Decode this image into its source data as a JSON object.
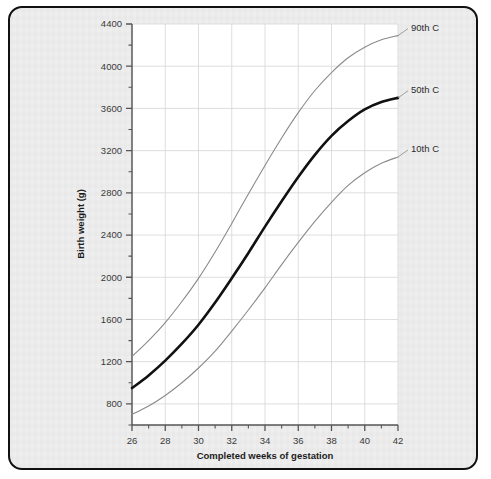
{
  "figure": {
    "frame_border_color": "#111111",
    "panel_background": "#eeeeee",
    "plot_background": "#ffffff",
    "grid_color": "#d6d6d6",
    "axis_color": "#555555",
    "caption": ""
  },
  "chart_data": {
    "type": "line",
    "title": "",
    "xlabel": "Completed weeks of gestation",
    "ylabel": "Birth weight (g)",
    "xlim": [
      26,
      42
    ],
    "ylim": [
      600,
      4400
    ],
    "grid": true,
    "legend_position": "right-of-line-ends",
    "x_ticks_major": [
      26,
      28,
      30,
      32,
      34,
      36,
      38,
      40,
      42
    ],
    "x_tick_labels": [
      "26",
      "28",
      "30",
      "32",
      "34",
      "36",
      "38",
      "40",
      "42"
    ],
    "x_ticks_minor": [
      27,
      29,
      31,
      33,
      35,
      37,
      39,
      41
    ],
    "y_ticks_major": [
      800,
      1200,
      1600,
      2000,
      2400,
      2800,
      3200,
      3600,
      4000,
      4400
    ],
    "y_tick_labels": [
      "800",
      "1200",
      "1600",
      "2000",
      "2400",
      "2800",
      "3200",
      "3600",
      "4000",
      "4400"
    ],
    "y_ticks_minor": [
      600,
      1000,
      1400,
      1800,
      2200,
      2600,
      3000,
      3400,
      3800,
      4200
    ],
    "x": [
      26,
      27,
      28,
      29,
      30,
      31,
      32,
      33,
      34,
      35,
      36,
      37,
      38,
      39,
      40,
      41,
      42
    ],
    "series": [
      {
        "name": "90th C",
        "label": "90th C",
        "color": "#8a8a8a",
        "width": 1.1,
        "values": [
          1250,
          1400,
          1570,
          1770,
          1990,
          2240,
          2510,
          2790,
          3060,
          3320,
          3560,
          3770,
          3940,
          4080,
          4180,
          4250,
          4290
        ]
      },
      {
        "name": "50th C",
        "label": "50th C",
        "color": "#111111",
        "width": 2.6,
        "values": [
          950,
          1070,
          1210,
          1370,
          1550,
          1760,
          1990,
          2230,
          2480,
          2720,
          2950,
          3160,
          3340,
          3480,
          3590,
          3660,
          3700
        ]
      },
      {
        "name": "10th C",
        "label": "10th C",
        "color": "#8a8a8a",
        "width": 1.1,
        "values": [
          700,
          780,
          880,
          1000,
          1140,
          1300,
          1490,
          1690,
          1900,
          2120,
          2330,
          2530,
          2710,
          2870,
          2990,
          3080,
          3140
        ]
      }
    ]
  }
}
